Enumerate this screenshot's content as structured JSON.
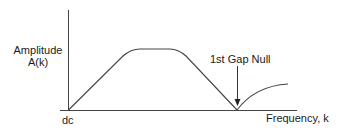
{
  "diagram": {
    "y_label_line1": "Amplitude",
    "y_label_line2": "A(k)",
    "x_origin_label": "dc",
    "x_axis_label": "Frequency, k",
    "annotation": "1st Gap Null",
    "colors": {
      "line": "#333333",
      "text": "#1a1a1a",
      "background": "#ffffff"
    }
  }
}
